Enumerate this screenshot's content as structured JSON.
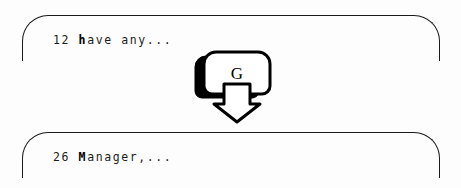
{
  "diagram": {
    "background_color": "#fdfdfd",
    "stroke_color": "#1a1a1a",
    "fill_color": "#ffffff",
    "shadow_color": "#000000"
  },
  "panels": [
    {
      "id": "top-panel",
      "line_number": "12",
      "text": "have any...",
      "bold_prefix": "h",
      "rest": "ave any...",
      "full_text": "12 have any..."
    },
    {
      "id": "bottom-panel",
      "line_number": "26",
      "text": "Manager,...",
      "bold_prefix": "M",
      "rest": "anager,...",
      "full_text": "26 Manager,..."
    }
  ],
  "key": {
    "label": "G",
    "name": "keycap-g",
    "arrow_direction": "down"
  }
}
